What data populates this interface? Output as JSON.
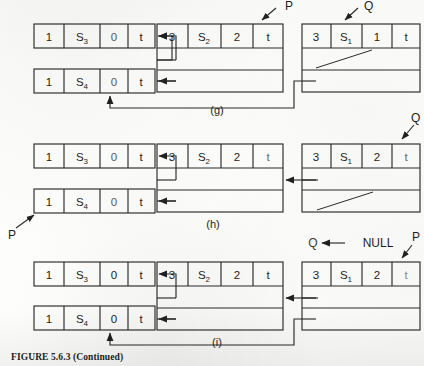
{
  "figure": {
    "caption": "FIGURE 5.6.3   (Continued)",
    "panels": [
      {
        "id": "g",
        "label": "(g)",
        "left_nodes": [
          {
            "name": "node-s3",
            "cells": [
              "1",
              "S",
              "3",
              "0",
              "t"
            ],
            "count": "1",
            "symbol": "S",
            "subscript": "3",
            "value": "0",
            "flag": "t"
          },
          {
            "name": "node-s4",
            "cells": [
              "1",
              "S",
              "4",
              "0",
              "t"
            ],
            "count": "1",
            "symbol": "S",
            "subscript": "4",
            "value": "0",
            "flag": "t"
          }
        ],
        "middle_node": {
          "count": "3",
          "symbol": "S",
          "subscript": "2",
          "value": "2",
          "flag": "t",
          "rows": 3
        },
        "right_node": {
          "count": "3",
          "symbol": "S",
          "subscript": "1",
          "value": "1",
          "flag": "t",
          "rows": 3,
          "slash_row": 2
        },
        "pointers": [
          {
            "name": "pointer-p",
            "label": "P",
            "target": "middle-node-flag-cell"
          },
          {
            "name": "pointer-q",
            "label": "Q",
            "target": "right-node-symbol-cell"
          }
        ]
      },
      {
        "id": "h",
        "label": "(h)",
        "left_nodes": [
          {
            "name": "node-s3",
            "cells": [
              "1",
              "S",
              "3",
              "0",
              "t"
            ],
            "count": "1",
            "symbol": "S",
            "subscript": "3",
            "value": "0",
            "flag": "t"
          },
          {
            "name": "node-s4",
            "cells": [
              "1",
              "S",
              "4",
              "0",
              "t"
            ],
            "count": "1",
            "symbol": "S",
            "subscript": "4",
            "value": "0",
            "flag": "t"
          }
        ],
        "middle_node": {
          "count": "3",
          "symbol": "S",
          "subscript": "2",
          "value": "2",
          "flag": "t",
          "rows": 3
        },
        "right_node": {
          "count": "3",
          "symbol": "S",
          "subscript": "1",
          "value": "2",
          "flag": "t",
          "rows": 3,
          "slash_row": 3
        },
        "pointers": [
          {
            "name": "pointer-p",
            "label": "P",
            "target": "node-s4-count-cell"
          },
          {
            "name": "pointer-q",
            "label": "Q",
            "target": "right-node-flag-cell"
          }
        ]
      },
      {
        "id": "i",
        "label": "(i)",
        "left_nodes": [
          {
            "name": "node-s3",
            "cells": [
              "1",
              "S",
              "3",
              "0",
              "t"
            ],
            "count": "1",
            "symbol": "S",
            "subscript": "3",
            "value": "0",
            "flag": "t"
          },
          {
            "name": "node-s4",
            "cells": [
              "1",
              "S",
              "4",
              "0",
              "t"
            ],
            "count": "1",
            "symbol": "S",
            "subscript": "4",
            "value": "0",
            "flag": "t"
          }
        ],
        "middle_node": {
          "count": "3",
          "symbol": "S",
          "subscript": "2",
          "value": "2",
          "flag": "t",
          "rows": 3
        },
        "right_node": {
          "count": "3",
          "symbol": "S",
          "subscript": "1",
          "value": "2",
          "flag": "t",
          "rows": 3,
          "slash_row": 0
        },
        "null_assignment": {
          "name": "q-null-assignment",
          "lhs": "Q",
          "arrow": "←",
          "rhs": "NULL"
        },
        "pointers": [
          {
            "name": "pointer-p",
            "label": "P",
            "target": "right-node-flag-cell"
          },
          {
            "name": "pointer-q",
            "label": "Q",
            "target": "null"
          }
        ]
      }
    ]
  },
  "colors": {
    "ink": "#1d1d1d",
    "line": "#2b2b2b",
    "paper": "#fdfdfb",
    "faint": "#6e6e6e"
  }
}
